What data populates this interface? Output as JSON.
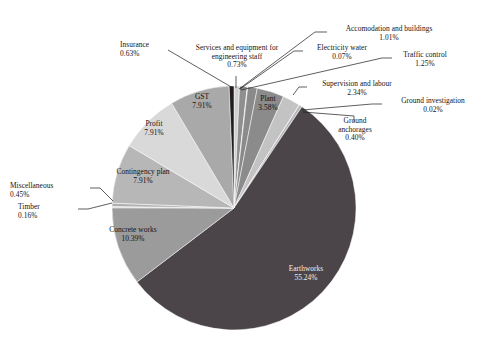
{
  "chart_data": {
    "type": "pie",
    "title": "",
    "subtitle": "",
    "xlabel": "",
    "ylabel": "",
    "legend_position": "none",
    "grid": false,
    "value_unit": "percent",
    "start_angle_deg": 0,
    "direction": "clockwise",
    "categories": [
      "Services and equipment for engineering staff",
      "Accomodation and buildings",
      "Electricity water",
      "Traffic control",
      "Plant",
      "Supervision and labour",
      "Ground investigation",
      "Ground anchorages",
      "Earthworks",
      "Concrete works",
      "Timber",
      "Miscellaneous",
      "Contingency plan",
      "Profit",
      "GST",
      "Insurance"
    ],
    "values": [
      0.73,
      1.01,
      0.07,
      1.25,
      3.58,
      2.34,
      0.02,
      0.4,
      55.24,
      10.39,
      0.16,
      0.45,
      7.91,
      7.91,
      7.91,
      0.63
    ],
    "value_labels": [
      "0.73%",
      "1.01%",
      "0.07%",
      "1.25%",
      "3.58%",
      "2.34%",
      "0.02%",
      "0.40%",
      "55.24%",
      "10.39%",
      "0.16%",
      "0.45%",
      "7.91%",
      "7.91%",
      "7.91%",
      "0.63%"
    ],
    "colors": [
      "#d0d0d0",
      "#8f8f8f",
      "#c6c6c6",
      "#8a8a8a",
      "#8b8b8b",
      "#c3c3c3",
      "#9a9a9a",
      "#b8b8b8",
      "#4b4549",
      "#9b9b9b",
      "#cdcdcd",
      "#b0b0b0",
      "#b7b7b7",
      "#d9d9d9",
      "#a9a9a9",
      "#201c20"
    ],
    "total": 100.0
  },
  "labels": {
    "insurance": {
      "name": "Insurance",
      "value": "0.63%"
    },
    "services": {
      "name": "Services and equipment for",
      "name2": "engineering staff",
      "value": "0.73%"
    },
    "accommodation": {
      "name": "Accomodation and buildings",
      "value": "1.01%"
    },
    "electricity": {
      "name": "Electricity water",
      "value": "0.07%"
    },
    "traffic": {
      "name": "Traffic control",
      "value": "1.25%"
    },
    "supervision": {
      "name": "Supervision and labour",
      "value": "2.34%"
    },
    "ground_invest": {
      "name": "Ground investigation",
      "value": "0.02%"
    },
    "ground_anchor": {
      "name": "Ground",
      "name2": "anchorages",
      "value": "0.40%"
    },
    "plant": {
      "name": "Plant",
      "value": "3.58%"
    },
    "gst": {
      "name": "GST",
      "value": "7.91%"
    },
    "profit": {
      "name": "Profit",
      "value": "7.91%"
    },
    "contingency": {
      "name": "Contingency plan",
      "value": "7.91%"
    },
    "miscellaneous": {
      "name": "Miscellaneous",
      "value": "0.45%"
    },
    "timber": {
      "name": "Timber",
      "value": "0.16%"
    },
    "concrete": {
      "name": "Concrete works",
      "value": "10.39%"
    },
    "earthworks": {
      "name": "Earthworks",
      "value": "55.24%"
    }
  }
}
